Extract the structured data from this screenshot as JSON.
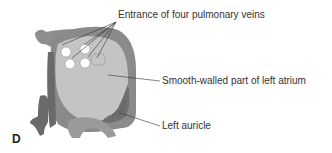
{
  "figure": {
    "panel_letter": "D",
    "colors": {
      "outer_wall": "#8a8a8a",
      "chamber": "#c4c4c4",
      "vessel_dark": "#6e6e6e",
      "auricle": "#7a7a7a",
      "vein_opening": "#ffffff",
      "leader_line": "#333333",
      "label_text": "#333333"
    },
    "labels": [
      {
        "id": "pulmonary-veins",
        "text": "Entrance of four pulmonary veins"
      },
      {
        "id": "smooth-walled",
        "text": "Smooth-walled part of left atrium"
      },
      {
        "id": "auricle",
        "text": "Left auricle"
      }
    ]
  }
}
